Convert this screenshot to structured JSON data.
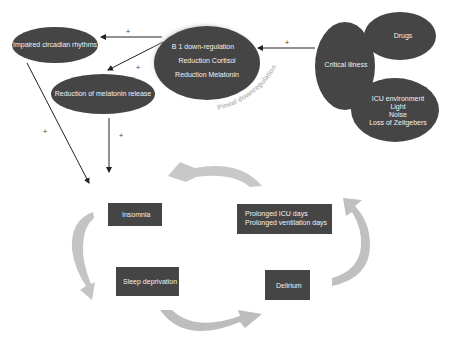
{
  "diagram": {
    "nodes": {
      "impaired_circadian": "Impaired circadian rhythms",
      "reduction_melatonin_release": "Reduction of melatonin release",
      "center": {
        "line1": "B 1 down-regulation",
        "line2": "Reduction Cortisol",
        "line3": "Reduction Melatonin"
      },
      "critical_illness": "Critical illness",
      "drugs": "Drugs",
      "icu_environment": {
        "line1": "ICU environment",
        "line2": "Light",
        "line3": "Noise",
        "line4": "Loss of Zeitgebers"
      }
    },
    "curved_label": "Pineal downregulation",
    "cycle": {
      "insomnia": "Insomnia",
      "prolonged": {
        "line1": "Prolonged ICU days",
        "line2": "Prolonged ventilation days"
      },
      "sleep_deprivation": "Sleep deprivation",
      "delirium": "Delirium"
    },
    "signs": {
      "plus": "+"
    },
    "colors": {
      "node_fill": "#454545",
      "cycle_arrow": "#bdbdbd",
      "line": "#222222",
      "background": "#ffffff"
    }
  }
}
